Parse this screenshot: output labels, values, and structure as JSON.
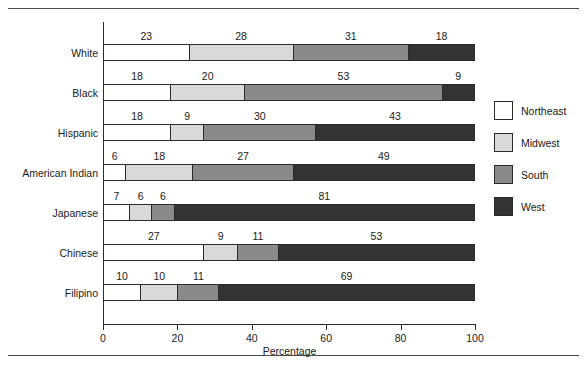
{
  "figure": {
    "background": "#ffffff",
    "rule_color": "#4a4a4a"
  },
  "chart_data": {
    "type": "bar",
    "orientation": "horizontal",
    "stacked": true,
    "title": "",
    "xlabel": "Percentage",
    "ylabel": "",
    "xlim": [
      0,
      100
    ],
    "xticks": [
      0,
      20,
      40,
      60,
      80,
      100
    ],
    "xtick_labels": [
      "0",
      "20",
      "40",
      "60",
      "80",
      "100"
    ],
    "grid": false,
    "legend_position": "right",
    "categories": [
      "White",
      "Black",
      "Hispanic",
      "American Indian",
      "Japanese",
      "Chinese",
      "Filipino"
    ],
    "series": [
      {
        "name": "Northeast",
        "color": "#ffffff",
        "values": [
          23,
          18,
          18,
          6,
          7,
          27,
          10
        ]
      },
      {
        "name": "Midwest",
        "color": "#d9d9d9",
        "values": [
          28,
          20,
          9,
          18,
          6,
          9,
          10
        ]
      },
      {
        "name": "South",
        "color": "#8a8a8a",
        "values": [
          31,
          53,
          30,
          27,
          6,
          11,
          11
        ]
      },
      {
        "name": "West",
        "color": "#333333",
        "values": [
          18,
          9,
          43,
          49,
          81,
          53,
          69
        ]
      }
    ],
    "rows": [
      {
        "label": "White",
        "segments": [
          {
            "region": "Northeast",
            "value": 23,
            "color": "#ffffff"
          },
          {
            "region": "Midwest",
            "value": 28,
            "color": "#d9d9d9"
          },
          {
            "region": "South",
            "value": 31,
            "color": "#8a8a8a"
          },
          {
            "region": "West",
            "value": 18,
            "color": "#333333"
          }
        ]
      },
      {
        "label": "Black",
        "segments": [
          {
            "region": "Northeast",
            "value": 18,
            "color": "#ffffff"
          },
          {
            "region": "Midwest",
            "value": 20,
            "color": "#d9d9d9"
          },
          {
            "region": "South",
            "value": 53,
            "color": "#8a8a8a"
          },
          {
            "region": "West",
            "value": 9,
            "color": "#333333"
          }
        ]
      },
      {
        "label": "Hispanic",
        "segments": [
          {
            "region": "Northeast",
            "value": 18,
            "color": "#ffffff"
          },
          {
            "region": "Midwest",
            "value": 9,
            "color": "#d9d9d9"
          },
          {
            "region": "South",
            "value": 30,
            "color": "#8a8a8a"
          },
          {
            "region": "West",
            "value": 43,
            "color": "#333333"
          }
        ]
      },
      {
        "label": "American Indian",
        "segments": [
          {
            "region": "Northeast",
            "value": 6,
            "color": "#ffffff"
          },
          {
            "region": "Midwest",
            "value": 18,
            "color": "#d9d9d9"
          },
          {
            "region": "South",
            "value": 27,
            "color": "#8a8a8a"
          },
          {
            "region": "West",
            "value": 49,
            "color": "#333333"
          }
        ]
      },
      {
        "label": "Japanese",
        "segments": [
          {
            "region": "Northeast",
            "value": 7,
            "color": "#ffffff"
          },
          {
            "region": "Midwest",
            "value": 6,
            "color": "#d9d9d9"
          },
          {
            "region": "South",
            "value": 6,
            "color": "#8a8a8a"
          },
          {
            "region": "West",
            "value": 81,
            "color": "#333333"
          }
        ]
      },
      {
        "label": "Chinese",
        "segments": [
          {
            "region": "Northeast",
            "value": 27,
            "color": "#ffffff"
          },
          {
            "region": "Midwest",
            "value": 9,
            "color": "#d9d9d9"
          },
          {
            "region": "South",
            "value": 11,
            "color": "#8a8a8a"
          },
          {
            "region": "West",
            "value": 53,
            "color": "#333333"
          }
        ]
      },
      {
        "label": "Filipino",
        "segments": [
          {
            "region": "Northeast",
            "value": 10,
            "color": "#ffffff"
          },
          {
            "region": "Midwest",
            "value": 10,
            "color": "#d9d9d9"
          },
          {
            "region": "South",
            "value": 11,
            "color": "#8a8a8a"
          },
          {
            "region": "West",
            "value": 69,
            "color": "#333333"
          }
        ]
      }
    ],
    "legend": [
      {
        "label": "Northeast",
        "color": "#ffffff"
      },
      {
        "label": "Midwest",
        "color": "#d9d9d9"
      },
      {
        "label": "South",
        "color": "#8a8a8a"
      },
      {
        "label": "West",
        "color": "#333333"
      }
    ]
  }
}
